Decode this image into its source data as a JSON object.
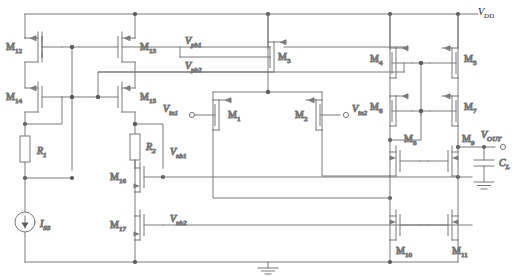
{
  "figure": {
    "kind": "circuit-schematic",
    "wire_color": "#7a7a7a",
    "text_color": "#1a1a1a",
    "background": "#ffffff"
  },
  "rails": {
    "vdd_label": "V",
    "vdd_sub": "DD",
    "ground_label": "GND"
  },
  "ports": {
    "vin1": {
      "base": "V",
      "sub": "in1"
    },
    "vin2": {
      "base": "V",
      "sub": "in2"
    },
    "vout": {
      "base": "V",
      "sub": "OUT"
    }
  },
  "bias_nets": [
    {
      "base": "V",
      "sub": "pb1"
    },
    {
      "base": "V",
      "sub": "pb2"
    },
    {
      "base": "V",
      "sub": "nb1"
    },
    {
      "base": "V",
      "sub": "nb2"
    }
  ],
  "passives": [
    {
      "name": "R1",
      "base": "R",
      "sub": "1",
      "type": "resistor"
    },
    {
      "name": "R2",
      "base": "R",
      "sub": "2",
      "type": "resistor"
    },
    {
      "name": "CL",
      "base": "C",
      "sub": "L",
      "type": "capacitor"
    }
  ],
  "sources": [
    {
      "name": "ISS",
      "base": "I",
      "sub": "SS",
      "type": "current-source"
    }
  ],
  "transistors": [
    {
      "name": "M1",
      "base": "M",
      "sub": "1",
      "channel": "pmos"
    },
    {
      "name": "M2",
      "base": "M",
      "sub": "2",
      "channel": "pmos"
    },
    {
      "name": "M3",
      "base": "M",
      "sub": "3",
      "channel": "pmos"
    },
    {
      "name": "M4",
      "base": "M",
      "sub": "4",
      "channel": "pmos"
    },
    {
      "name": "M5",
      "base": "M",
      "sub": "5",
      "channel": "pmos"
    },
    {
      "name": "M6",
      "base": "M",
      "sub": "6",
      "channel": "pmos"
    },
    {
      "name": "M7",
      "base": "M",
      "sub": "7",
      "channel": "pmos"
    },
    {
      "name": "M8",
      "base": "M",
      "sub": "8",
      "channel": "nmos"
    },
    {
      "name": "M9",
      "base": "M",
      "sub": "9",
      "channel": "nmos"
    },
    {
      "name": "M10",
      "base": "M",
      "sub": "10",
      "channel": "nmos"
    },
    {
      "name": "M11",
      "base": "M",
      "sub": "11",
      "channel": "nmos"
    },
    {
      "name": "M12",
      "base": "M",
      "sub": "12",
      "channel": "pmos"
    },
    {
      "name": "M13",
      "base": "M",
      "sub": "13",
      "channel": "pmos"
    },
    {
      "name": "M14",
      "base": "M",
      "sub": "14",
      "channel": "pmos"
    },
    {
      "name": "M15",
      "base": "M",
      "sub": "15",
      "channel": "pmos"
    },
    {
      "name": "M16",
      "base": "M",
      "sub": "16",
      "channel": "nmos"
    },
    {
      "name": "M17",
      "base": "M",
      "sub": "17",
      "channel": "nmos"
    }
  ]
}
